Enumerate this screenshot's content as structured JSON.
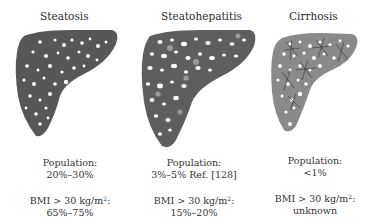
{
  "stages": [
    {
      "title": "Steatosis",
      "population_label": "Population:",
      "population_value": "20%–30%",
      "bmi_label": "BMI > 30 kg/m",
      "bmi_sup": "2",
      "bmi_colon": ":",
      "bmi_value": "65%–75%",
      "fill_color": "#575757"
    },
    {
      "title": "Steatohepatitis",
      "population_label": "Population:",
      "population_value": "3%–5% Ref. [128]",
      "bmi_label": "BMI > 30 kg/m",
      "bmi_sup": "2",
      "bmi_colon": ":",
      "bmi_value": "15%–20%",
      "fill_color": "#5e5e5e"
    },
    {
      "title": "Cirrhosis",
      "population_label": "Population:",
      "population_value": "<1%",
      "bmi_label": "BMI > 30 kg/m",
      "bmi_sup": "2",
      "bmi_colon": ":",
      "bmi_value": "unknown",
      "fill_color": "#8a8a8a"
    }
  ]
}
